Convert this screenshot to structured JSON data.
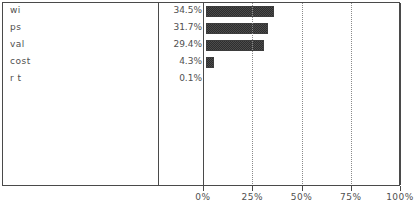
{
  "chart_data": {
    "type": "bar",
    "orientation": "horizontal",
    "title": "",
    "xlabel": "",
    "ylabel": "",
    "categories": [
      "wi",
      "ps",
      "val",
      "cost",
      "r t"
    ],
    "values": [
      34.5,
      31.7,
      29.4,
      4.3,
      0.1
    ],
    "value_labels": [
      "34.5%",
      "31.7%",
      "29.4%",
      "4.3%",
      "0.1%"
    ],
    "xlim": [
      0,
      100
    ],
    "xticks": [
      0,
      25,
      50,
      75,
      100
    ],
    "xtick_labels": [
      "0%",
      "25%",
      "50%",
      "75%",
      "100%"
    ],
    "grid": true,
    "grid_style": "dotted-vertical",
    "legend": "none",
    "bar_color": "#3d3d3d",
    "bar_fill_pattern": "checkered-dither",
    "frame_color": "#4a4a4a",
    "text_color": "#4f4f4f"
  },
  "rows": [
    {
      "label": "wi",
      "value_label": "34.5%",
      "value": 34.5
    },
    {
      "label": "ps",
      "value_label": "31.7%",
      "value": 31.7
    },
    {
      "label": "val",
      "value_label": "29.4%",
      "value": 29.4
    },
    {
      "label": "cost",
      "value_label": "4.3%",
      "value": 4.3
    },
    {
      "label": "r t",
      "value_label": "0.1%",
      "value": 0.1
    }
  ],
  "axis": {
    "ticks": [
      {
        "label": "0%",
        "value": 0
      },
      {
        "label": "25%",
        "value": 25
      },
      {
        "label": "50%",
        "value": 50
      },
      {
        "label": "75%",
        "value": 75
      },
      {
        "label": "100%",
        "value": 100
      }
    ]
  }
}
